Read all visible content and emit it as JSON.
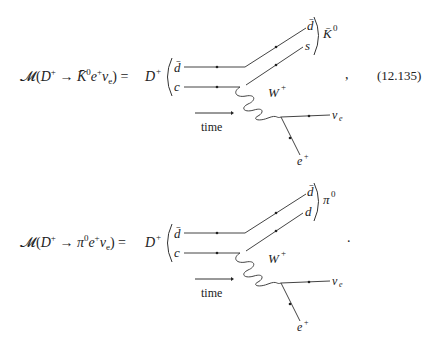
{
  "equations": [
    {
      "lhs": {
        "script_M": "𝓜",
        "open": "(",
        "initial": "D",
        "initial_sup": "+",
        "arrow": "→",
        "meson": "K̄",
        "meson_sup": "0",
        "lepton": "e",
        "lepton_sup": "+",
        "neutrino": "ν",
        "neutrino_sub": "e",
        "close": ")",
        "equals": "="
      },
      "diagram": {
        "initial_state": "D",
        "initial_state_sup": "+",
        "quark_top_in": "d̄",
        "quark_bottom_in": "c",
        "quark_top_out": "d̄",
        "quark_bottom_out": "s",
        "final_meson": "K̄",
        "final_meson_sup": "0",
        "boson": "W",
        "boson_sup": "+",
        "neutrino": "ν",
        "neutrino_sub": "e",
        "lepton": "e",
        "lepton_sup": "+",
        "time_label": "time"
      },
      "trailing_punct": ",",
      "number": "(12.135)"
    },
    {
      "lhs": {
        "script_M": "𝓜",
        "open": "(",
        "initial": "D",
        "initial_sup": "+",
        "arrow": "→",
        "meson": "π",
        "meson_sup": "0",
        "lepton": "e",
        "lepton_sup": "+",
        "neutrino": "ν",
        "neutrino_sub": "e",
        "close": ")",
        "equals": "="
      },
      "diagram": {
        "initial_state": "D",
        "initial_state_sup": "+",
        "quark_top_in": "d̄",
        "quark_bottom_in": "c",
        "quark_top_out": "d̄",
        "quark_bottom_out": "d",
        "final_meson": "π",
        "final_meson_sup": "0",
        "boson": "W",
        "boson_sup": "+",
        "neutrino": "ν",
        "neutrino_sub": "e",
        "lepton": "e",
        "lepton_sup": "+",
        "time_label": "time"
      },
      "trailing_punct": ".",
      "number": ""
    }
  ]
}
